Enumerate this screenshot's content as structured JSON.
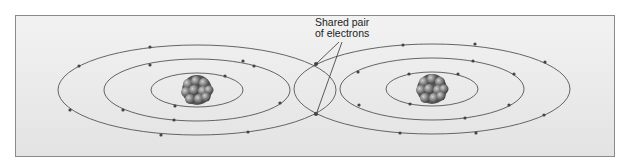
{
  "diagram": {
    "label_line1": "Shared pair",
    "label_line2": "of electrons",
    "colors": {
      "orbit": "#555555",
      "electron": "#444444",
      "nucleus": "#7a7a7a",
      "background": "#ededed"
    },
    "atoms": [
      {
        "name": "left-atom",
        "cx": 197,
        "cy": 90
      },
      {
        "name": "right-atom",
        "cx": 432,
        "cy": 89
      }
    ]
  }
}
